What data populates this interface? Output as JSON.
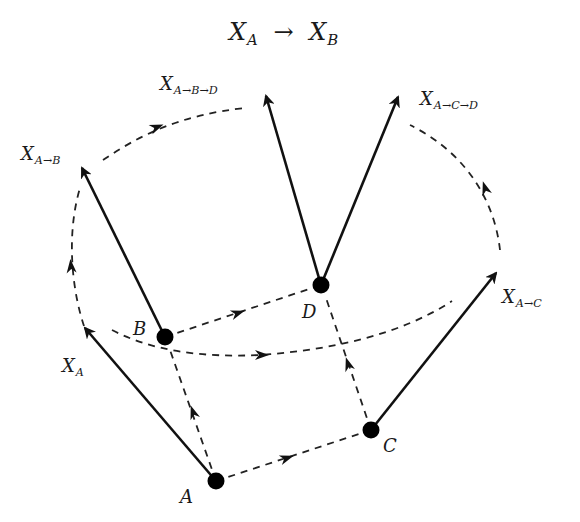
{
  "title": {
    "base": "X",
    "sub_left": "A",
    "arrow": "→",
    "base2": "X",
    "sub_right": "B"
  },
  "nodes": [
    {
      "id": "A",
      "label": "A",
      "x": 216,
      "y": 481
    },
    {
      "id": "B",
      "label": "B",
      "x": 165,
      "y": 337
    },
    {
      "id": "C",
      "label": "C",
      "x": 371,
      "y": 430
    },
    {
      "id": "D",
      "label": "D",
      "x": 321,
      "y": 285
    }
  ],
  "vectors": [
    {
      "id": "XA",
      "base": "X",
      "sub": "A",
      "from": "A",
      "tip": [
        85,
        328
      ]
    },
    {
      "id": "XAB",
      "base": "X",
      "sub": "A→B",
      "from": "B",
      "tip": [
        82,
        168
      ]
    },
    {
      "id": "XABD",
      "base": "X",
      "sub": "A→B→D",
      "from": "D",
      "tip": [
        266,
        96
      ]
    },
    {
      "id": "XACD",
      "base": "X",
      "sub": "A→C→D",
      "from": "D",
      "tip": [
        398,
        97
      ]
    },
    {
      "id": "XAC",
      "base": "X",
      "sub": "A→C",
      "from": "C",
      "tip": [
        496,
        273
      ]
    }
  ],
  "transport_edges": [
    {
      "from": "A",
      "to": "B",
      "style": "dashed-arrow"
    },
    {
      "from": "A",
      "to": "C",
      "style": "dashed-arrow"
    },
    {
      "from": "B",
      "to": "D",
      "style": "dashed-arrow"
    },
    {
      "from": "C",
      "to": "D",
      "style": "dashed-arrow"
    }
  ],
  "transport_curves": [
    {
      "id": "XA-to-XAB",
      "description": "parallel transport of X_A to X_{A→B}"
    },
    {
      "id": "XAB-to-XABD",
      "description": "parallel transport of X_{A→B} to X_{A→B→D}"
    },
    {
      "id": "XA-to-XAC",
      "description": "parallel transport of X_A to X_{A→C}"
    },
    {
      "id": "XAC-to-XACD",
      "description": "parallel transport of X_{A→C} to X_{A→C→D}"
    }
  ]
}
